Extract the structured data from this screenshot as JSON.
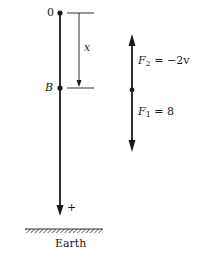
{
  "diagram": {
    "origin_label": "0",
    "point_b_label": "B",
    "displacement_label": "x",
    "positive_direction_label": "+",
    "ground_label": "Earth",
    "forces": [
      {
        "symbol": "F",
        "subscript": "2",
        "expression": "= −2v",
        "direction": "up"
      },
      {
        "symbol": "F",
        "subscript": "1",
        "expression": "= 8",
        "direction": "down"
      }
    ],
    "colors": {
      "line": "#1a1a1a",
      "background": "#ffffff"
    }
  }
}
